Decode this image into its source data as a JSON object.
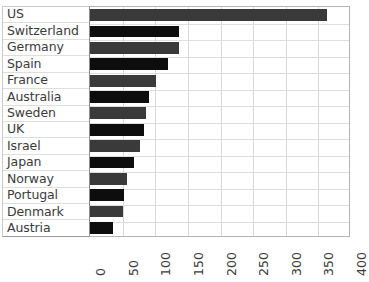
{
  "chart_data": {
    "type": "bar",
    "orientation": "horizontal",
    "title": "",
    "xlabel": "",
    "ylabel": "",
    "xlim": [
      0,
      400
    ],
    "xticks": [
      "0",
      "50",
      "100",
      "150",
      "200",
      "250",
      "300",
      "350",
      "400"
    ],
    "xtick_values": [
      0,
      50,
      100,
      150,
      200,
      250,
      300,
      350,
      400
    ],
    "grid": true,
    "legend": false,
    "categories": [
      "US",
      "Switzerland",
      "Germany",
      "Spain",
      "France",
      "Australia",
      "Sweden",
      "UK",
      "Israel",
      "Japan",
      "Norway",
      "Portugal",
      "Denmark",
      "Austria"
    ],
    "values": [
      363,
      137,
      136,
      120,
      101,
      91,
      86,
      82,
      76,
      68,
      57,
      52,
      50,
      35
    ],
    "bar_colors": [
      "#3a3a3a",
      "#0d0d0d",
      "#3a3a3a",
      "#0d0d0d",
      "#3a3a3a",
      "#0d0d0d",
      "#3a3a3a",
      "#0d0d0d",
      "#3a3a3a",
      "#0d0d0d",
      "#3a3a3a",
      "#0d0d0d",
      "#3a3a3a",
      "#0d0d0d"
    ]
  },
  "style": {
    "grid_color": "#d8d8d8",
    "axis_color": "#8d8d8d",
    "text_color": "#3b3b3b",
    "background": "#ffffff"
  }
}
